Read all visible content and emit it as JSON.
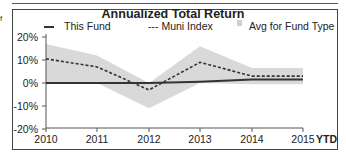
{
  "chart_data": {
    "type": "line",
    "title": "Annualized Total Return",
    "xlabel": "",
    "ylabel": "",
    "categories": [
      "2010",
      "2011",
      "2012",
      "2013",
      "2014",
      "2015"
    ],
    "x_suffix_label": "YTD",
    "y_ticks": [
      "20%",
      "10%",
      "0%",
      "-10%",
      "-20%"
    ],
    "ylim": [
      -20,
      20
    ],
    "grid": false,
    "legend_position": "top",
    "series": [
      {
        "name": "This Fund",
        "style": "solid",
        "values": [
          0,
          0,
          0,
          0.5,
          1.5,
          1.5
        ]
      },
      {
        "name": "--- Muni Index",
        "style": "dashed",
        "values": [
          10.5,
          7,
          -3,
          9,
          3,
          3
        ]
      },
      {
        "name": "Avg for Fund Type",
        "style": "band",
        "upper": [
          17,
          12,
          0,
          16,
          6.5,
          6.5
        ],
        "lower": [
          0,
          0,
          -11,
          0,
          -0.5,
          -0.5
        ]
      }
    ]
  },
  "legend": {
    "fund": "This Fund",
    "index": "--- Muni Index",
    "avg": "Avg for Fund Type"
  },
  "edge_text": "f",
  "colors": {
    "band": "#d9d9d9",
    "line": "#333333",
    "frame": "#444444"
  }
}
